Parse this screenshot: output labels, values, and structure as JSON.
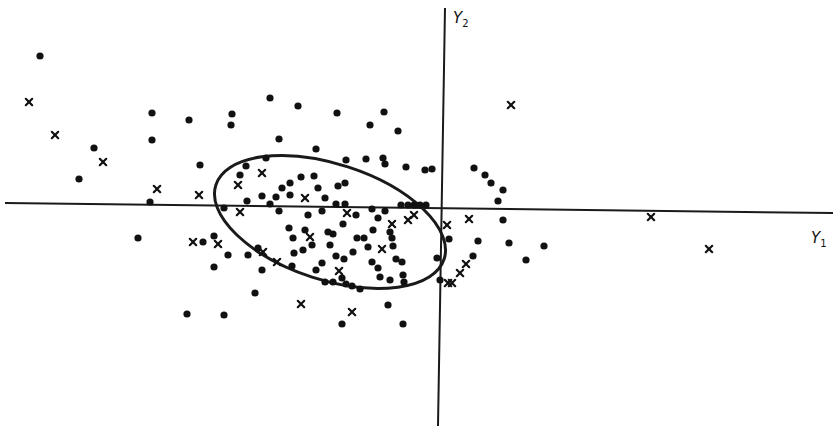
{
  "chart_data": {
    "type": "scatter",
    "title": "",
    "xlabel": "Y1",
    "ylabel": "Y2",
    "grid": false,
    "legend": null,
    "coordinate_system": "pixel positions in 837x438 image; x-axis (Y1) drawn at y≈203-213, y-axis (Y2) drawn at x≈437-444",
    "axes": {
      "x_axis": {
        "label": "Y",
        "subscript": "1",
        "x1": 5,
        "y1": 203,
        "x2": 833,
        "y2": 213
      },
      "y_axis": {
        "label": "Y",
        "subscript": "2",
        "x1": 445,
        "y1": 8,
        "x2": 438,
        "y2": 426
      }
    },
    "ellipse": {
      "cx": 330,
      "cy": 222,
      "rx": 120,
      "ry": 58,
      "rotation_deg": 18
    },
    "series": [
      {
        "name": "dots",
        "marker": "circle",
        "points": [
          [
            40,
            56
          ],
          [
            79,
            179
          ],
          [
            94,
            148
          ],
          [
            138,
            238
          ],
          [
            150,
            202
          ],
          [
            152,
            113
          ],
          [
            152,
            140
          ],
          [
            189,
            120
          ],
          [
            200,
            165
          ],
          [
            203,
            242
          ],
          [
            187,
            314
          ],
          [
            214,
            236
          ],
          [
            214,
            267
          ],
          [
            224,
            315
          ],
          [
            232,
            114
          ],
          [
            231,
            125
          ],
          [
            224,
            208
          ],
          [
            240,
            175
          ],
          [
            246,
            166
          ],
          [
            247,
            201
          ],
          [
            255,
            293
          ],
          [
            270,
            98
          ],
          [
            266,
            158
          ],
          [
            279,
            139
          ],
          [
            270,
            204
          ],
          [
            276,
            197
          ],
          [
            279,
            211
          ],
          [
            298,
            106
          ],
          [
            282,
            188
          ],
          [
            290,
            183
          ],
          [
            293,
            238
          ],
          [
            301,
            177
          ],
          [
            316,
            149
          ],
          [
            314,
            176
          ],
          [
            336,
            204
          ],
          [
            337,
            113
          ],
          [
            338,
            186
          ],
          [
            345,
            183
          ],
          [
            346,
            160
          ],
          [
            346,
            284
          ],
          [
            342,
            324
          ],
          [
            370,
            125
          ],
          [
            366,
            159
          ],
          [
            372,
            209
          ],
          [
            373,
            230
          ],
          [
            384,
            112
          ],
          [
            383,
            158
          ],
          [
            385,
            164
          ],
          [
            388,
            305
          ],
          [
            403,
            324
          ],
          [
            398,
            131
          ],
          [
            406,
            167
          ],
          [
            392,
            238
          ],
          [
            393,
            246
          ],
          [
            396,
            259
          ],
          [
            402,
            262
          ],
          [
            403,
            275
          ],
          [
            404,
            282
          ],
          [
            401,
            205
          ],
          [
            408,
            205
          ],
          [
            414,
            205
          ],
          [
            420,
            205
          ],
          [
            426,
            205
          ],
          [
            425,
            170
          ],
          [
            432,
            169
          ],
          [
            437,
            258
          ],
          [
            440,
            280
          ],
          [
            474,
            168
          ],
          [
            485,
            175
          ],
          [
            491,
            183
          ],
          [
            503,
            190
          ],
          [
            498,
            201
          ],
          [
            503,
            220
          ],
          [
            509,
            243
          ],
          [
            526,
            260
          ],
          [
            544,
            246
          ],
          [
            473,
            256
          ],
          [
            478,
            241
          ],
          [
            449,
            239
          ],
          [
            228,
            255
          ],
          [
            248,
            255
          ],
          [
            258,
            248
          ],
          [
            262,
            270
          ],
          [
            289,
            228
          ],
          [
            294,
            253
          ],
          [
            292,
            266
          ],
          [
            303,
            250
          ],
          [
            312,
            245
          ],
          [
            316,
            270
          ],
          [
            322,
            263
          ],
          [
            325,
            282
          ],
          [
            333,
            282
          ],
          [
            342,
            278
          ],
          [
            352,
            286
          ],
          [
            360,
            289
          ],
          [
            328,
            232
          ],
          [
            330,
            245
          ],
          [
            336,
            256
          ],
          [
            344,
            259
          ],
          [
            353,
            252
          ],
          [
            357,
            238
          ],
          [
            364,
            238
          ],
          [
            368,
            247
          ],
          [
            372,
            262
          ],
          [
            378,
            268
          ],
          [
            380,
            277
          ],
          [
            390,
            280
          ],
          [
            356,
            215
          ],
          [
            343,
            224
          ],
          [
            333,
            234
          ],
          [
            322,
            211
          ],
          [
            308,
            215
          ],
          [
            305,
            230
          ],
          [
            378,
            218
          ],
          [
            385,
            211
          ],
          [
            390,
            232
          ],
          [
            345,
            204
          ],
          [
            325,
            198
          ],
          [
            318,
            188
          ],
          [
            290,
            195
          ],
          [
            262,
            196
          ]
        ]
      },
      {
        "name": "crosses",
        "marker": "x",
        "points": [
          [
            29,
            102
          ],
          [
            55,
            135
          ],
          [
            103,
            162
          ],
          [
            157,
            189
          ],
          [
            199,
            195
          ],
          [
            193,
            242
          ],
          [
            218,
            244
          ],
          [
            238,
            185
          ],
          [
            262,
            173
          ],
          [
            305,
            198
          ],
          [
            240,
            212
          ],
          [
            263,
            252
          ],
          [
            277,
            262
          ],
          [
            310,
            237
          ],
          [
            339,
            271
          ],
          [
            347,
            213
          ],
          [
            352,
            312
          ],
          [
            301,
            304
          ],
          [
            382,
            249
          ],
          [
            392,
            224
          ],
          [
            408,
            220
          ],
          [
            414,
            215
          ],
          [
            447,
            225
          ],
          [
            469,
            219
          ],
          [
            466,
            264
          ],
          [
            460,
            273
          ],
          [
            452,
            283
          ],
          [
            448,
            283
          ],
          [
            511,
            105
          ],
          [
            651,
            217
          ],
          [
            709,
            249
          ]
        ]
      }
    ]
  }
}
